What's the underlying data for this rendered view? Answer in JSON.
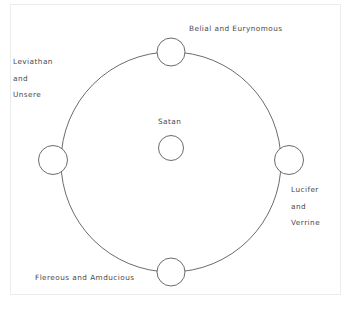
{
  "diagram": {
    "type": "circular-hierarchy",
    "title": null,
    "center": {
      "name": "center-node",
      "label": "Satan"
    },
    "nodes": [
      {
        "position": "top",
        "label": "Belial and Eurynomous"
      },
      {
        "position": "left",
        "label_lines": [
          "Leviathan",
          "and",
          "Unsere"
        ]
      },
      {
        "position": "right",
        "label_lines": [
          "Lucifer",
          "and",
          "Verrine"
        ]
      },
      {
        "position": "bottom",
        "label": "Flereous and Amducious"
      }
    ],
    "labels": {
      "top": "Belial and Eurynomous",
      "left_line1": "Leviathan",
      "left_line2": "and",
      "left_line3": "Unsere",
      "right_line1": "Lucifer",
      "right_line2": "and",
      "right_line3": "Verrine",
      "bottom": "Flereous and Amducious",
      "center": "Satan"
    },
    "colors": {
      "background": "#ffffff",
      "stroke": "#5a5a5a",
      "text": "#4a4a4a",
      "frame": "#ececec"
    }
  }
}
